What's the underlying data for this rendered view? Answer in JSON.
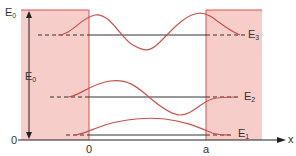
{
  "diagram": {
    "colors": {
      "barrier_fill": "#f6cdc8",
      "barrier_edge": "#d9534f",
      "wave": "#c9504a",
      "level_line": "#333333",
      "axis": "#222222",
      "text": "#333333"
    },
    "labels": {
      "e0_top": "E",
      "e0_top_sub": "0",
      "e0_mid": "E",
      "e0_mid_sub": "0",
      "zero_energy": "0",
      "x_zero": "0",
      "x_a": "a",
      "x_axis": "x",
      "e1": "E",
      "e1_sub": "1",
      "e2": "E",
      "e2_sub": "2",
      "e3": "E",
      "e3_sub": "3"
    },
    "energy_levels": [
      {
        "name": "E1",
        "y": 135,
        "nodes": 0
      },
      {
        "name": "E2",
        "y": 97,
        "nodes": 1
      },
      {
        "name": "E3",
        "y": 35,
        "nodes": 2
      }
    ],
    "well": {
      "left_x": 89,
      "right_x": 206,
      "top_y": 10,
      "bottom_y": 140
    }
  }
}
